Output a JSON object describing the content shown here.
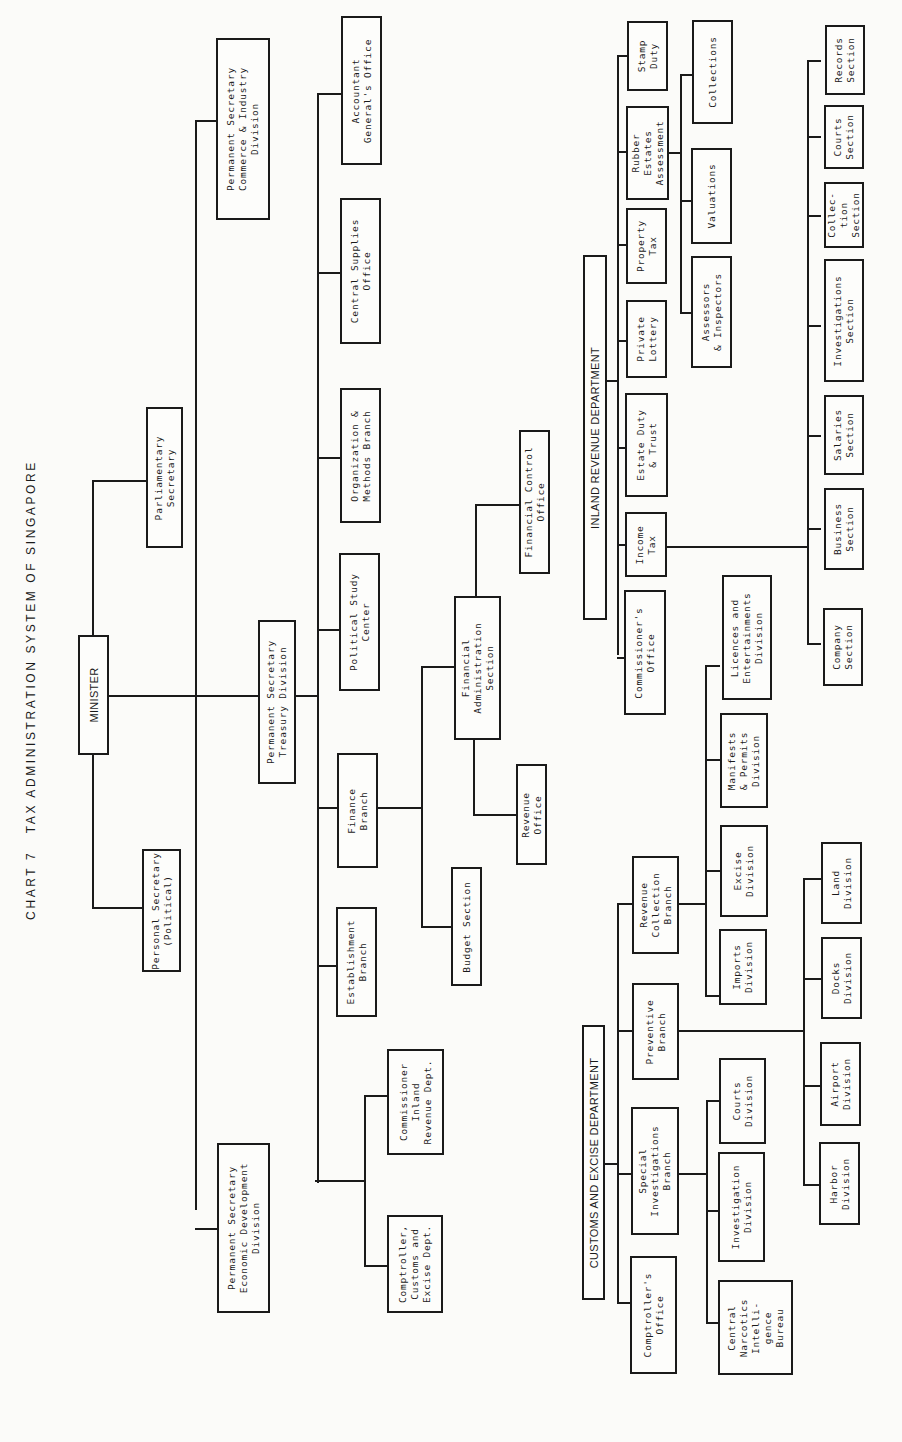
{
  "chart_title": "CHART 7   TAX ADMINISTRATION SYSTEM OF SINGAPORE",
  "nodes": {
    "minister": "MINISTER",
    "parliamentary_secretary": "Parliamentary\nSecretary",
    "personal_secretary": "Personal Secretary\n(Political)",
    "ps_commerce": "Permanent Secretary\nCommerce & Industry\nDivision",
    "ps_economic": "Permanent Secretary\nEconomic Development\nDivision",
    "ps_treasury": "Permanent Secretary\nTreasury Division",
    "accountant_general": "Accountant\nGeneral's Office",
    "central_supplies": "Central Supplies\nOffice",
    "org_methods": "Organization &\nMethods Branch",
    "political_study": "Political Study\nCenter",
    "finance_branch": "Finance\nBranch",
    "establishment_branch": "Establishment\nBranch",
    "commissioner_ird": "Commissioner\nInland\nRevenue Dept.",
    "comptroller_customs": "Comptroller,\nCustoms and\nExcise Dept.",
    "financial_control": "Financial Control\nOffice",
    "financial_admin": "Financial\nAdministration\nSection",
    "revenue_office": "Revenue\nOffice",
    "budget_section": "Budget Section",
    "ird_header": "INLAND REVENUE DEPARTMENT",
    "stamp_duty": "Stamp\nDuty",
    "rubber_estates": "Rubber\nEstates\nAssessment",
    "property_tax": "Property\nTax",
    "private_lottery": "Private\nLottery",
    "estate_duty": "Estate Duty\n& Trust",
    "income_tax": "Income\nTax",
    "commissioners_office": "Commissioner's\nOffice",
    "collections": "Collections",
    "valuations": "Valuations",
    "assessors": "Assessors\n& Inspectors",
    "records_section": "Records\nSection",
    "courts_section": "Courts\nSection",
    "collection_section": "Collec-\ntion\nSection",
    "investigations_section": "Investigations\nSection",
    "salaries_section": "Salaries\nSection",
    "business_section": "Business\nSection",
    "company_section": "Company\nSection",
    "customs_header": "CUSTOMS AND EXCISE DEPARTMENT",
    "revenue_collection_branch": "Revenue\nCollection\nBranch",
    "preventive_branch": "Preventive\nBranch",
    "special_investigations": "Special\nInvestigations\nBranch",
    "comptrollers_office": "Comptroller's\nOffice",
    "licences_division": "Licences and\nEntertainments\nDivision",
    "manifests_division": "Manifests\n& Permits\nDivision",
    "excise_division": "Excise\nDivision",
    "imports_division": "Imports\nDivision",
    "land_division": "Land\nDivision",
    "docks_division": "Docks\nDivision",
    "airport_division": "Airport\nDivision",
    "harbor_division": "Harbor\nDivision",
    "courts_division": "Courts\nDivision",
    "investigation_division": "Investigation\nDivision",
    "narcotics_bureau": "Central\nNarcotics\nIntelli-\ngence\nBureau"
  }
}
